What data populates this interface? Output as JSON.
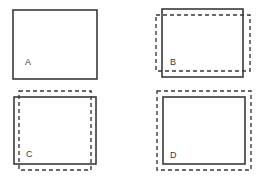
{
  "diagram": {
    "panels": [
      {
        "label": "A",
        "solid_rect": {
          "x": 13,
          "y": 10,
          "w": 84,
          "h": 69
        },
        "dashed_rect": null,
        "label_pos": {
          "x": 25,
          "y": 65
        }
      },
      {
        "label": "B",
        "solid_rect": {
          "x": 162,
          "y": 9,
          "w": 81,
          "h": 68
        },
        "dashed_rect": {
          "x": 156,
          "y": 15,
          "w": 94,
          "h": 56
        },
        "label_pos": {
          "x": 170,
          "y": 65
        }
      },
      {
        "label": "C",
        "solid_rect": {
          "x": 14,
          "y": 97,
          "w": 82,
          "h": 67
        },
        "dashed_rect": {
          "x": 19,
          "y": 91,
          "w": 72,
          "h": 79
        },
        "label_pos": {
          "x": 26,
          "y": 157
        }
      },
      {
        "label": "D",
        "solid_rect": {
          "x": 163,
          "y": 97,
          "w": 82,
          "h": 67
        },
        "dashed_rect": {
          "x": 157,
          "y": 91,
          "w": 94,
          "h": 79
        },
        "label_pos": {
          "x": 170,
          "y": 158
        }
      }
    ]
  }
}
